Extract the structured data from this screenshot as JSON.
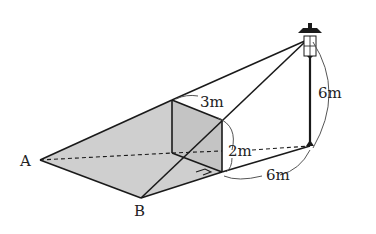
{
  "diagram": {
    "type": "geometry-shadow-problem",
    "points": {
      "A": "A",
      "B": "B"
    },
    "measurements": {
      "wall_width": "3m",
      "wall_height": "2m",
      "lamp_height": "6m",
      "lamp_distance": "6m"
    },
    "colors": {
      "shadow_fill": "#cfcfcf",
      "line": "#1a1a1a"
    }
  }
}
